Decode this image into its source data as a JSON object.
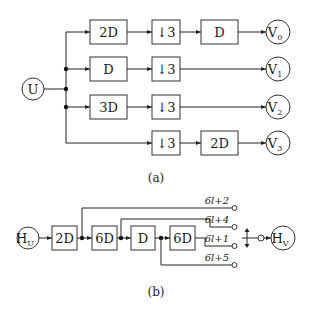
{
  "figure_a": {
    "input_node": "U",
    "branches": [
      {
        "first_block": "2D",
        "downsampler": "↓3",
        "second_block": "D",
        "output": "V",
        "output_sub": "0"
      },
      {
        "first_block": "D",
        "downsampler": "↓3",
        "second_block": "",
        "output": "V",
        "output_sub": "1"
      },
      {
        "first_block": "3D",
        "downsampler": "↓3",
        "second_block": "",
        "output": "V",
        "output_sub": "2"
      },
      {
        "first_block": "",
        "downsampler": "↓3",
        "second_block": "2D",
        "output": "V",
        "output_sub": "3"
      }
    ],
    "caption": "(a)"
  },
  "figure_b": {
    "input_node": "H",
    "input_sub": "U",
    "chain_blocks": [
      "2D",
      "6D",
      "D",
      "6D"
    ],
    "taps": [
      "6l+2",
      "6l+4",
      "6l+1",
      "6l+5"
    ],
    "output_node": "H",
    "output_sub": "V",
    "caption": "(b)"
  }
}
